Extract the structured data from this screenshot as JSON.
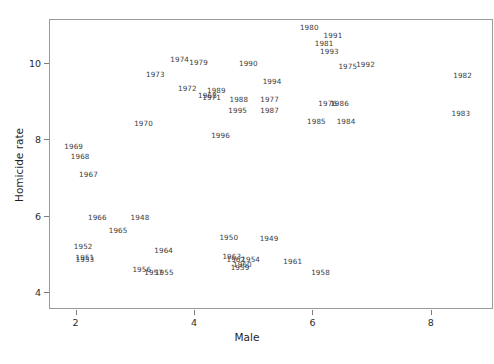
{
  "chart_data": {
    "type": "scatter",
    "title": "",
    "xlabel": "Male",
    "ylabel": "Homicide rate",
    "xlim": [
      1.55,
      9.05
    ],
    "ylim": [
      3.55,
      11.15
    ],
    "xticks": [
      2,
      4,
      6,
      8
    ],
    "yticks": [
      4,
      6,
      8,
      10
    ],
    "xtick_labels": [
      "2",
      "4",
      "6",
      "8"
    ],
    "ytick_labels": [
      "4",
      "6",
      "8",
      "10"
    ],
    "grid": false,
    "legend": null,
    "marker_style": "text-label",
    "point_label_field": "year",
    "points": [
      {
        "year": "1980",
        "x": 5.93,
        "y": 10.94
      },
      {
        "year": "1991",
        "x": 6.33,
        "y": 10.72
      },
      {
        "year": "1981",
        "x": 6.18,
        "y": 10.53
      },
      {
        "year": "1993",
        "x": 6.27,
        "y": 10.32
      },
      {
        "year": "1974",
        "x": 3.74,
        "y": 10.1
      },
      {
        "year": "1979",
        "x": 4.06,
        "y": 10.02
      },
      {
        "year": "1990",
        "x": 4.9,
        "y": 10.0
      },
      {
        "year": "1975",
        "x": 6.58,
        "y": 9.92
      },
      {
        "year": "1992",
        "x": 6.88,
        "y": 9.96
      },
      {
        "year": "1973",
        "x": 3.33,
        "y": 9.7
      },
      {
        "year": "1982",
        "x": 8.52,
        "y": 9.68
      },
      {
        "year": "1994",
        "x": 5.3,
        "y": 9.53
      },
      {
        "year": "1972",
        "x": 3.87,
        "y": 9.33
      },
      {
        "year": "1989",
        "x": 4.36,
        "y": 9.28
      },
      {
        "year": "1968",
        "x": 4.21,
        "y": 9.17
      },
      {
        "year": "1971",
        "x": 4.28,
        "y": 9.1
      },
      {
        "year": "1988",
        "x": 4.74,
        "y": 9.05
      },
      {
        "year": "1977",
        "x": 5.26,
        "y": 9.05
      },
      {
        "year": "1976",
        "x": 6.24,
        "y": 8.96
      },
      {
        "year": "1986",
        "x": 6.44,
        "y": 8.96
      },
      {
        "year": "1983",
        "x": 8.49,
        "y": 8.68
      },
      {
        "year": "1995",
        "x": 4.72,
        "y": 8.77
      },
      {
        "year": "1987",
        "x": 5.26,
        "y": 8.77
      },
      {
        "year": "1985",
        "x": 6.05,
        "y": 8.47
      },
      {
        "year": "1984",
        "x": 6.55,
        "y": 8.47
      },
      {
        "year": "1970",
        "x": 3.13,
        "y": 8.42
      },
      {
        "year": "1996",
        "x": 4.43,
        "y": 8.1
      },
      {
        "year": "1969",
        "x": 1.95,
        "y": 7.82
      },
      {
        "year": "1968",
        "x": 2.06,
        "y": 7.55
      },
      {
        "year": "1967",
        "x": 2.2,
        "y": 7.1
      },
      {
        "year": "1966",
        "x": 2.35,
        "y": 5.96
      },
      {
        "year": "1948",
        "x": 3.07,
        "y": 5.96
      },
      {
        "year": "1965",
        "x": 2.7,
        "y": 5.62
      },
      {
        "year": "1950",
        "x": 4.57,
        "y": 5.45
      },
      {
        "year": "1949",
        "x": 5.25,
        "y": 5.42
      },
      {
        "year": "1952",
        "x": 2.11,
        "y": 5.2
      },
      {
        "year": "1964",
        "x": 3.47,
        "y": 5.1
      },
      {
        "year": "1963",
        "x": 4.62,
        "y": 4.95
      },
      {
        "year": "1951",
        "x": 2.14,
        "y": 4.92
      },
      {
        "year": "1953",
        "x": 2.14,
        "y": 4.85
      },
      {
        "year": "1962",
        "x": 4.69,
        "y": 4.85
      },
      {
        "year": "1954",
        "x": 4.94,
        "y": 4.85
      },
      {
        "year": "1961",
        "x": 5.65,
        "y": 4.8
      },
      {
        "year": "1960",
        "x": 4.8,
        "y": 4.72
      },
      {
        "year": "1959",
        "x": 4.76,
        "y": 4.65
      },
      {
        "year": "1956",
        "x": 3.1,
        "y": 4.6
      },
      {
        "year": "1957",
        "x": 3.3,
        "y": 4.53
      },
      {
        "year": "1955",
        "x": 3.48,
        "y": 4.53
      },
      {
        "year": "1958",
        "x": 6.12,
        "y": 4.53
      }
    ]
  },
  "axes": {
    "x_axis_label": "Male",
    "y_axis_label": "Homicide rate"
  }
}
